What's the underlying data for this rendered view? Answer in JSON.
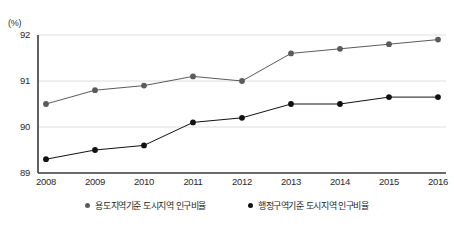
{
  "unit_label": "(%)",
  "clipped_title": "",
  "legend": {
    "position": "bottom-center",
    "items": [
      {
        "label": "용도지역기준 도시지역 인구비율",
        "color": "#5b5b5b",
        "marker": "legend-dot-icon"
      },
      {
        "label": "행정구역기준 도시지역 인구비율",
        "color": "#111111",
        "marker": "legend-dot-icon"
      }
    ]
  },
  "axes": {
    "y_ticks": [
      "89",
      "90",
      "91",
      "92"
    ],
    "x_ticks": [
      "2008",
      "2009",
      "2010",
      "2011",
      "2012",
      "2013",
      "2014",
      "2015",
      "2016"
    ]
  },
  "chart_data": {
    "type": "line",
    "title": "",
    "xlabel": "",
    "ylabel": "(%)",
    "ylim": [
      89,
      92
    ],
    "yticks": [
      89,
      90,
      91,
      92
    ],
    "grid": "horizontal",
    "legend_position": "bottom-center",
    "categories": [
      "2008",
      "2009",
      "2010",
      "2011",
      "2012",
      "2013",
      "2014",
      "2015",
      "2016"
    ],
    "series": [
      {
        "name": "용도지역기준 도시지역 인구비율",
        "color": "#5b5b5b",
        "values": [
          90.5,
          90.8,
          90.9,
          91.1,
          91.0,
          91.6,
          91.7,
          91.8,
          91.9
        ]
      },
      {
        "name": "행정구역기준 도시지역 인구비율",
        "color": "#111111",
        "values": [
          89.3,
          89.5,
          89.6,
          90.1,
          90.2,
          90.5,
          90.5,
          90.65,
          90.65
        ]
      }
    ]
  }
}
